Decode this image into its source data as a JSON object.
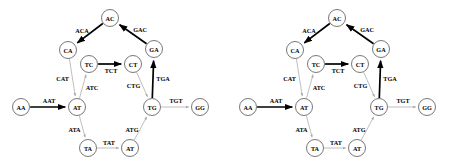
{
  "figure": {
    "type": "diagram",
    "subtype": "de-bruijn-graph",
    "panel_count": 2,
    "colors": {
      "background": "#ffffff",
      "node_stroke": "#555555",
      "edge_bold": "#000000",
      "edge_light": "#aaaaaa",
      "text": "#000000"
    }
  },
  "graph": {
    "nodes": [
      {
        "id": "AA",
        "label": "AA",
        "x": 21,
        "y": 107
      },
      {
        "id": "AT1",
        "label": "AT",
        "x": 77,
        "y": 107
      },
      {
        "id": "CA",
        "label": "CA",
        "x": 68,
        "y": 50
      },
      {
        "id": "AC",
        "label": "AC",
        "x": 110,
        "y": 18
      },
      {
        "id": "GA",
        "label": "GA",
        "x": 154,
        "y": 49
      },
      {
        "id": "TC",
        "label": "TC",
        "x": 89,
        "y": 64
      },
      {
        "id": "CT",
        "label": "CT",
        "x": 133,
        "y": 64
      },
      {
        "id": "TG",
        "label": "TG",
        "x": 152,
        "y": 107
      },
      {
        "id": "GG",
        "label": "GG",
        "x": 200,
        "y": 107
      },
      {
        "id": "TA",
        "label": "TA",
        "x": 88,
        "y": 148
      },
      {
        "id": "AT2",
        "label": "AT",
        "x": 130,
        "y": 148
      }
    ],
    "node_radius": 8.5,
    "edges": [
      {
        "from": "AA",
        "to": "AT1",
        "label": "AAT",
        "weight": "bold",
        "label_dx": 0,
        "label_dy": -7
      },
      {
        "from": "AC",
        "to": "CA",
        "label": "ACA",
        "weight": "bold",
        "label_dx": -7,
        "label_dy": -4
      },
      {
        "from": "GA",
        "to": "AC",
        "label": "GAC",
        "weight": "bold",
        "label_dx": 8,
        "label_dy": -4
      },
      {
        "from": "CA",
        "to": "AT1",
        "label": "CAT",
        "weight": "light",
        "label_dx": -10,
        "label_dy": 0
      },
      {
        "from": "AT1",
        "to": "TC",
        "label": "ATC",
        "weight": "light",
        "label_dx": 9,
        "label_dy": 2
      },
      {
        "from": "TC",
        "to": "CT",
        "label": "TCT",
        "weight": "bold",
        "label_dx": 0,
        "label_dy": 6
      },
      {
        "from": "CT",
        "to": "TG",
        "label": "CTG",
        "weight": "light",
        "label_dx": -9,
        "label_dy": 0
      },
      {
        "from": "TG",
        "to": "GA",
        "label": "TGA",
        "weight": "bold",
        "label_dx": 10,
        "label_dy": 0
      },
      {
        "from": "TG",
        "to": "GG",
        "label": "TGT",
        "weight": "light",
        "label_dx": 0,
        "label_dy": -7
      },
      {
        "from": "AT1",
        "to": "TA",
        "label": "ATA",
        "weight": "light",
        "label_dx": -8,
        "label_dy": 2
      },
      {
        "from": "TA",
        "to": "AT2",
        "label": "TAT",
        "weight": "light",
        "label_dx": 0,
        "label_dy": -6
      },
      {
        "from": "AT2",
        "to": "TG",
        "label": "ATG",
        "weight": "light",
        "label_dx": -9,
        "label_dy": 2
      }
    ]
  },
  "panels": [
    {
      "name": "left-panel",
      "offset_x": 0,
      "bold_edges": [
        "AAT",
        "ACA",
        "GAC",
        "TCT",
        "TGA"
      ]
    },
    {
      "name": "right-panel",
      "offset_x": 227,
      "bold_edges": [
        "AAT",
        "ACA",
        "GAC",
        "TCT",
        "TGA"
      ]
    }
  ]
}
